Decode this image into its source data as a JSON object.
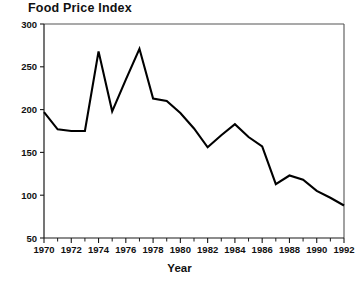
{
  "chart_data": {
    "type": "line",
    "title": "Food Price Index",
    "subtitle": "",
    "xlabel": "Year",
    "ylabel": "",
    "x": [
      1970,
      1971,
      1972,
      1973,
      1974,
      1975,
      1976,
      1977,
      1978,
      1979,
      1980,
      1981,
      1982,
      1983,
      1984,
      1985,
      1986,
      1987,
      1988,
      1989,
      1990,
      1991,
      1992
    ],
    "values": [
      197,
      177,
      175,
      175,
      268,
      198,
      235,
      271,
      213,
      210,
      196,
      178,
      156,
      170,
      183,
      168,
      157,
      113,
      123,
      118,
      105,
      97,
      88
    ],
    "series": [
      {
        "name": "Food Price Index",
        "values": [
          197,
          177,
          175,
          175,
          268,
          198,
          235,
          271,
          213,
          210,
          196,
          178,
          156,
          170,
          183,
          168,
          157,
          113,
          123,
          118,
          105,
          97,
          88
        ],
        "color": "#000000"
      }
    ],
    "xlim": [
      1970,
      1992
    ],
    "ylim": [
      50,
      300
    ],
    "ytick_labels": [
      "50",
      "100",
      "150",
      "200",
      "250",
      "300"
    ],
    "ytick_values": [
      50,
      100,
      150,
      200,
      250,
      300
    ],
    "xtick_values": [
      1970,
      1971,
      1972,
      1973,
      1974,
      1975,
      1976,
      1977,
      1978,
      1979,
      1980,
      1981,
      1982,
      1983,
      1984,
      1985,
      1986,
      1987,
      1988,
      1989,
      1990,
      1991,
      1992
    ],
    "xtick_labels_shown": [
      "1970",
      "1972",
      "1974",
      "1976",
      "1978",
      "1980",
      "1982",
      "1984",
      "1986",
      "1988",
      "1990",
      "1992"
    ],
    "xtick_label_values": [
      1970,
      1972,
      1974,
      1976,
      1978,
      1980,
      1982,
      1984,
      1986,
      1988,
      1990,
      1992
    ],
    "grid": false,
    "legend": false,
    "legend_position": "none",
    "line_color": "#000000",
    "background_color": "#ffffff",
    "axis_color": "#1a1a1a"
  }
}
